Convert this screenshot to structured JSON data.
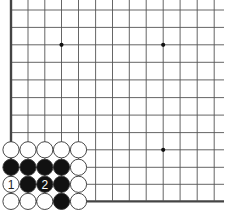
{
  "diagram": {
    "type": "go-board-partial",
    "view": "lower-left corner",
    "colors": {
      "background": "#ffffff",
      "grid_line": "#555555",
      "border_line": "#444444",
      "black_stone": "#111111",
      "white_stone": "#ffffff",
      "stone_outline": "#333333"
    },
    "grid": {
      "columns_x": [
        11,
        28,
        44.8,
        61.5,
        78.5,
        95.6,
        112.5,
        129.3,
        146.2,
        163.2,
        180.1,
        197.2,
        214.2
      ],
      "rows_y": [
        10,
        27.4,
        44.8,
        62.3,
        79.9,
        97.6,
        115.1,
        132.6,
        149.8,
        167.3,
        184.3,
        201.4
      ],
      "right_extent": 224,
      "top_extent": 0
    },
    "star_points": [
      {
        "col": 3,
        "row": 2
      },
      {
        "col": 9,
        "row": 2
      },
      {
        "col": 9,
        "row": 8
      }
    ],
    "stones": [
      {
        "col": 0,
        "row": 8,
        "color": "white"
      },
      {
        "col": 1,
        "row": 8,
        "color": "white"
      },
      {
        "col": 2,
        "row": 8,
        "color": "white"
      },
      {
        "col": 3,
        "row": 8,
        "color": "white"
      },
      {
        "col": 4,
        "row": 8,
        "color": "white"
      },
      {
        "col": 0,
        "row": 9,
        "color": "black"
      },
      {
        "col": 1,
        "row": 9,
        "color": "black"
      },
      {
        "col": 2,
        "row": 9,
        "color": "black"
      },
      {
        "col": 3,
        "row": 9,
        "color": "black"
      },
      {
        "col": 4,
        "row": 9,
        "color": "white"
      },
      {
        "col": 0,
        "row": 10,
        "color": "white",
        "label": "1"
      },
      {
        "col": 1,
        "row": 10,
        "color": "black"
      },
      {
        "col": 2,
        "row": 10,
        "color": "black",
        "label": "2"
      },
      {
        "col": 3,
        "row": 10,
        "color": "black"
      },
      {
        "col": 4,
        "row": 10,
        "color": "white"
      },
      {
        "col": 0,
        "row": 11,
        "color": "white"
      },
      {
        "col": 1,
        "row": 11,
        "color": "white"
      },
      {
        "col": 2,
        "row": 11,
        "color": "white"
      },
      {
        "col": 3,
        "row": 11,
        "color": "black"
      },
      {
        "col": 4,
        "row": 11,
        "color": "white"
      }
    ],
    "caption": ""
  }
}
